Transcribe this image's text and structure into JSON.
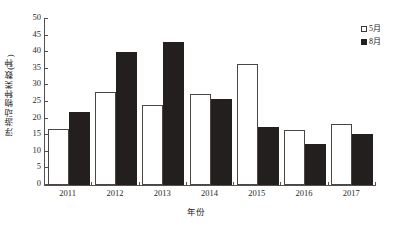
{
  "chart_data": {
    "type": "bar",
    "title": "",
    "xlabel": "年份",
    "ylabel": "浮游动物种类数(种)",
    "categories": [
      "2011",
      "2012",
      "2013",
      "2014",
      "2015",
      "2016",
      "2017"
    ],
    "series": [
      {
        "name": "5月",
        "values": [
          17,
          28,
          24,
          27.5,
          36.5,
          16.5,
          18.5
        ],
        "color": "#ffffff",
        "edge_color": "#4a4643"
      },
      {
        "name": "8月",
        "values": [
          22,
          40,
          43,
          26,
          17.5,
          12.5,
          15.3
        ],
        "color": "#231f1e",
        "edge_color": "#231f1e"
      }
    ],
    "ylim": [
      0,
      50
    ],
    "ytick_step": 5,
    "yticks": [
      0,
      5,
      10,
      15,
      20,
      25,
      30,
      35,
      40,
      45,
      50
    ],
    "grid": false,
    "legend_position": "top-right",
    "legend_entries": [
      "5月",
      "8月"
    ]
  },
  "axes": {
    "y_title": "浮游动物种类数(种)",
    "x_title": "年份"
  },
  "legend": {
    "items": [
      {
        "label": "5月",
        "swatch": "hollow-square-icon"
      },
      {
        "label": "8月",
        "swatch": "filled-square-icon"
      }
    ]
  },
  "colors": {
    "bar_may_fill": "#ffffff",
    "bar_may_stroke": "#4a4643",
    "bar_aug_fill": "#231f1e",
    "axis": "#55504d",
    "background": "#ffffff",
    "text": "#2a2a2a"
  }
}
